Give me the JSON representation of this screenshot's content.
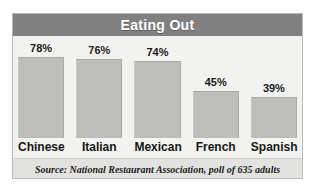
{
  "chart_data": {
    "type": "bar",
    "title": "Eating Out",
    "xlabel": "",
    "ylabel": "",
    "ylim": [
      0,
      100
    ],
    "grid": false,
    "legend": "none",
    "categories": [
      "Chinese",
      "Italian",
      "Mexican",
      "French",
      "Spanish"
    ],
    "values": [
      78,
      76,
      74,
      45,
      39
    ],
    "value_labels": [
      "78%",
      "76%",
      "74%",
      "45%",
      "39%"
    ],
    "annotations": [
      "Source: National Restaurant Association, poll of 635 adults"
    ]
  },
  "chart": {
    "title": "Eating Out",
    "source": "Source: National Restaurant Association, poll of 635 adults",
    "bars": [
      {
        "label": "Chinese",
        "value": 78,
        "value_label": "78%"
      },
      {
        "label": "Italian",
        "value": 76,
        "value_label": "76%"
      },
      {
        "label": "Mexican",
        "value": 74,
        "value_label": "74%"
      },
      {
        "label": "French",
        "value": 45,
        "value_label": "45%"
      },
      {
        "label": "Spanish",
        "value": 39,
        "value_label": "39%"
      }
    ]
  },
  "colors": {
    "title_band": "#808080",
    "title_text": "#ffffff",
    "bar_fill": "#bdbdbb",
    "plot_background": "#f2f2f0",
    "source_band": "#e2e2e0",
    "frame_border": "#b9b9b6",
    "label_text": "#161616"
  }
}
